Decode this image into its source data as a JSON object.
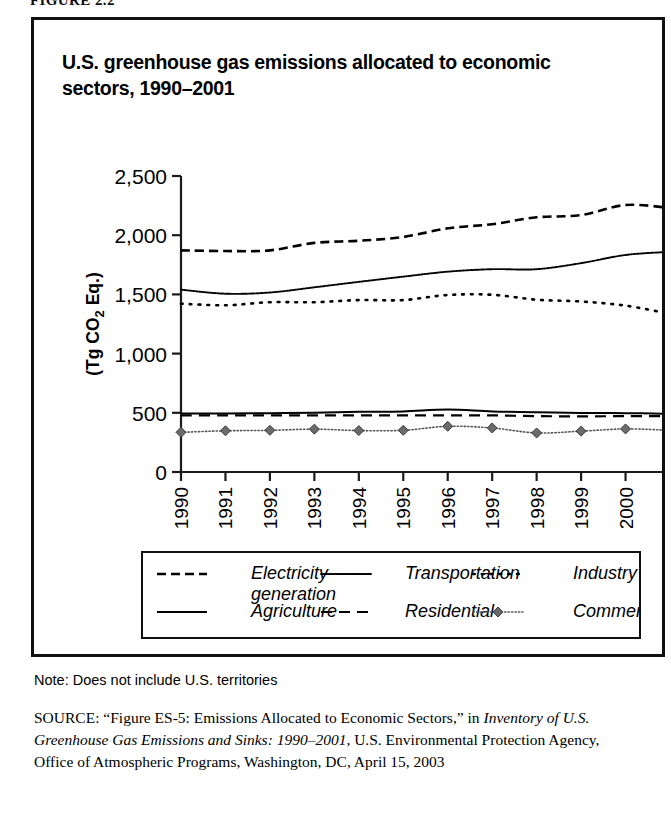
{
  "figure_label": "FIGURE 2.2",
  "panel": {
    "title": "U.S. greenhouse gas emissions allocated to economic sectors, 1990–2001"
  },
  "note": {
    "text": "Note: Does not include U.S. territories"
  },
  "source": {
    "prefix": "SOURCE:",
    "line1": " “Figure ES-5: Emissions Allocated to Economic Sectors,” in",
    "italic": "Inventory of U.S. Greenhouse Gas Emissions and Sinks: 1990–2001",
    "line2": ", U.S. Environmental Protection Agency, Office of Atmospheric Programs, Washington, DC, April 15, 2003"
  },
  "chart_data": {
    "type": "line",
    "title": "U.S. greenhouse gas emissions allocated to economic sectors, 1990–2001",
    "xlabel": "Year",
    "ylabel": "(Tg CO2 Eq.)",
    "ylabel_parts": {
      "pre": "(Tg CO",
      "sub": "2",
      "post": " Eq.)"
    },
    "categories": [
      "1990",
      "1991",
      "1992",
      "1993",
      "1994",
      "1995",
      "1996",
      "1997",
      "1998",
      "1999",
      "2000",
      "2001"
    ],
    "xlim": [
      1990,
      2001
    ],
    "ylim": [
      0,
      2500
    ],
    "yticks": [
      0,
      500,
      1000,
      1500,
      2000,
      2500
    ],
    "ytick_labels": [
      "0",
      "500",
      "1,000",
      "1,500",
      "2,000",
      "2,500"
    ],
    "grid": false,
    "legend_position": "below-plot",
    "series": [
      {
        "name": "Electricity generation",
        "style": "dashed",
        "marker": "none",
        "color": "#000000",
        "values": [
          1872,
          1866,
          1872,
          1935,
          1953,
          1985,
          2058,
          2093,
          2151,
          2170,
          2255,
          2230
        ]
      },
      {
        "name": "Transportation",
        "style": "fine-dotted",
        "marker": "none",
        "color": "#000000",
        "values": [
          1540,
          1506,
          1516,
          1560,
          1606,
          1650,
          1692,
          1713,
          1713,
          1764,
          1833,
          1860
        ]
      },
      {
        "name": "Industry",
        "style": "sparse-dotted",
        "marker": "none",
        "color": "#000000",
        "values": [
          1422,
          1408,
          1434,
          1434,
          1452,
          1452,
          1495,
          1497,
          1455,
          1440,
          1405,
          1336
        ]
      },
      {
        "name": "Agriculture",
        "style": "solid",
        "marker": "none",
        "color": "#000000",
        "values": [
          494,
          494,
          497,
          500,
          508,
          512,
          528,
          511,
          505,
          498,
          497,
          492
        ]
      },
      {
        "name": "Residential",
        "style": "long-dashed",
        "marker": "none",
        "color": "#000000",
        "values": [
          478,
          478,
          478,
          478,
          478,
          478,
          478,
          478,
          472,
          470,
          472,
          472
        ]
      },
      {
        "name": "Commercial",
        "style": "dotted-marker",
        "marker": "diamond",
        "color": "#555555",
        "values": [
          335,
          348,
          352,
          362,
          350,
          352,
          386,
          372,
          330,
          345,
          364,
          352
        ]
      }
    ]
  },
  "legend": {
    "items": [
      {
        "label": "Electricity",
        "label2": "generation",
        "style": "dashed"
      },
      {
        "label": "Transportation",
        "style": "fine-dotted"
      },
      {
        "label": "Industry",
        "style": "sparse-dotted"
      },
      {
        "label": "Agriculture",
        "style": "solid"
      },
      {
        "label": "Residential",
        "style": "long-dashed"
      },
      {
        "label": "Commercial",
        "style": "dotted-marker"
      }
    ]
  }
}
